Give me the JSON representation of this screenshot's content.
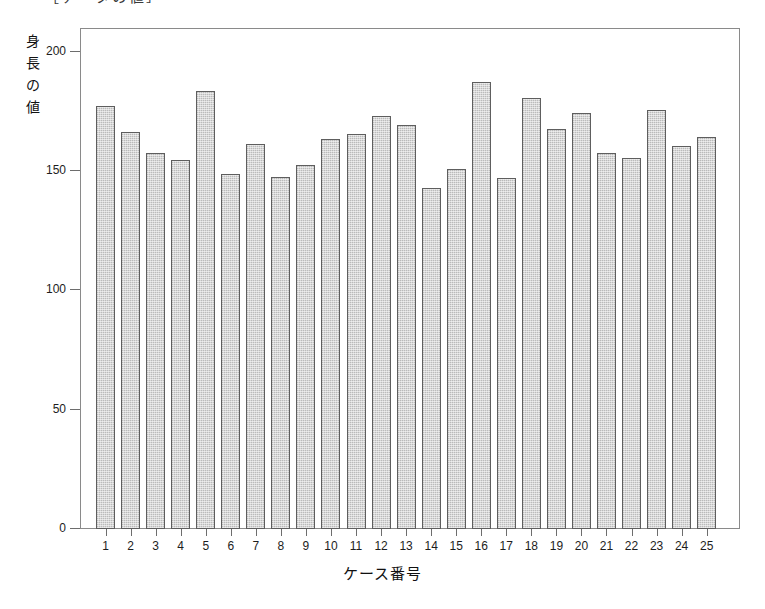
{
  "figure": {
    "top_fragment_text": "［データの値］",
    "background_color": "#ffffff",
    "frame_color": "#8a8a8a",
    "bar_fill_color": "#d7d7d7",
    "bar_edge_color": "#5e5e5e"
  },
  "chart_data": {
    "type": "bar",
    "title": "",
    "xlabel": "ケース番号",
    "ylabel": "身長の値",
    "ylabel_chars": [
      "身",
      "長",
      "の",
      "値"
    ],
    "categories": [
      "1",
      "2",
      "3",
      "4",
      "5",
      "6",
      "7",
      "8",
      "9",
      "10",
      "11",
      "12",
      "13",
      "14",
      "15",
      "16",
      "17",
      "18",
      "19",
      "20",
      "21",
      "22",
      "23",
      "24",
      "25"
    ],
    "values": [
      177.5,
      166.5,
      157.5,
      154.5,
      183.5,
      149.0,
      161.5,
      147.5,
      152.5,
      163.5,
      165.5,
      173.0,
      169.5,
      143.0,
      151.0,
      187.5,
      147.0,
      180.5,
      167.5,
      174.5,
      157.5,
      155.5,
      175.5,
      160.5,
      164.5
    ],
    "ylim": [
      0,
      210
    ],
    "yticks": [
      0,
      50,
      100,
      150,
      200
    ],
    "ytick_labels": [
      "0",
      "50",
      "100",
      "150",
      "200"
    ],
    "xtick_labels": [
      "1",
      "2",
      "3",
      "4",
      "5",
      "6",
      "7",
      "8",
      "9",
      "10",
      "11",
      "12",
      "13",
      "14",
      "15",
      "16",
      "17",
      "18",
      "19",
      "20",
      "21",
      "22",
      "23",
      "24",
      "25"
    ],
    "grid": false,
    "legend": null,
    "legend_position": "none"
  }
}
